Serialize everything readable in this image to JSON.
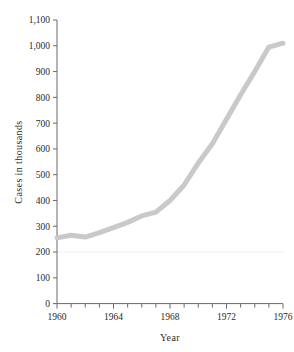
{
  "chart_data": {
    "type": "line",
    "title": "",
    "xlabel": "Year",
    "ylabel": "Cases in thousands",
    "xlim": [
      1960,
      1976
    ],
    "ylim": [
      0,
      1100
    ],
    "grid": false,
    "legend": null,
    "x_major_ticks": [
      1960,
      1964,
      1968,
      1972,
      1976
    ],
    "x_major_tick_labels": [
      "1960",
      "1964",
      "1968",
      "1972",
      "1976"
    ],
    "x_minor_tick_step": 1,
    "y_ticks": [
      0,
      100,
      200,
      300,
      400,
      500,
      600,
      700,
      800,
      900,
      1000,
      1100
    ],
    "y_tick_labels": [
      "0",
      "100",
      "200",
      "300",
      "400",
      "500",
      "600",
      "700",
      "800",
      "900",
      "1,000",
      "1,100"
    ],
    "faint_reference_line_y": 200,
    "line_color": "#c9c9c9",
    "line_width_px": 5,
    "series": [
      {
        "name": "Cases",
        "x": [
          1960,
          1961,
          1962,
          1963,
          1964,
          1965,
          1966,
          1967,
          1968,
          1969,
          1970,
          1971,
          1972,
          1973,
          1974,
          1975,
          1976
        ],
        "values": [
          255,
          265,
          258,
          275,
          295,
          315,
          340,
          355,
          400,
          460,
          545,
          620,
          715,
          810,
          900,
          995,
          1010
        ]
      }
    ]
  },
  "axes": {
    "y_axis_label": "Cases in thousands",
    "x_axis_label": "Year"
  }
}
